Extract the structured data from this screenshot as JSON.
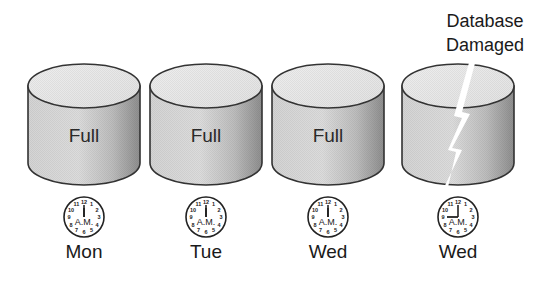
{
  "diagram": {
    "type": "backup-timeline",
    "damage_label_line1": "Database",
    "damage_label_line2": "Damaged",
    "colors": {
      "cylinder_top": "#e6e6e6",
      "cylinder_body_light": "#e0e0e0",
      "cylinder_body_dark": "#9a9a9a",
      "outline": "#333333",
      "lightning": "#ffffff"
    },
    "items": [
      {
        "label": "Full",
        "clock_time": "12:00",
        "clock_period": "A.M.",
        "day": "Mon",
        "damaged": false
      },
      {
        "label": "Full",
        "clock_time": "12:00",
        "clock_period": "A.M.",
        "day": "Tue",
        "damaged": false
      },
      {
        "label": "Full",
        "clock_time": "12:00",
        "clock_period": "A.M.",
        "day": "Wed",
        "damaged": false
      },
      {
        "label": "",
        "clock_time": "9:00",
        "clock_period": "A.M.",
        "day": "Wed",
        "damaged": true
      }
    ],
    "clock_numbers": [
      "12",
      "1",
      "2",
      "3",
      "4",
      "5",
      "6",
      "7",
      "8",
      "9",
      "10",
      "11"
    ]
  }
}
